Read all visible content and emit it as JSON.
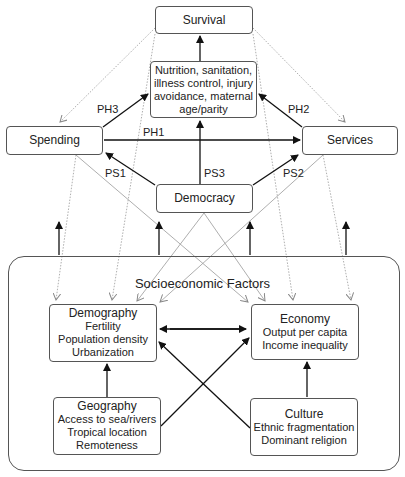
{
  "nodes": {
    "survival": {
      "title": "Survival"
    },
    "proximate": {
      "lines": [
        "Nutrition, sanitation,",
        "illness control, injury",
        "avoidance, maternal",
        "age/parity"
      ]
    },
    "spending": {
      "title": "Spending"
    },
    "services": {
      "title": "Services"
    },
    "democracy": {
      "title": "Democracy"
    },
    "demography": {
      "title": "Demography",
      "lines": [
        "Fertility",
        "Population density",
        "Urbanization"
      ]
    },
    "economy": {
      "title": "Economy",
      "lines": [
        "Output per capita",
        "Income inequality"
      ]
    },
    "geography": {
      "title": "Geography",
      "lines": [
        "Access to sea/rivers",
        "Tropical location",
        "Remoteness"
      ]
    },
    "culture": {
      "title": "Culture",
      "lines": [
        "Ethnic fragmentation",
        "Dominant religion"
      ]
    }
  },
  "group": {
    "title": "Socioeconomic Factors"
  },
  "edge_labels": {
    "ph1": "PH1",
    "ph2": "PH2",
    "ph3": "PH3",
    "ps1": "PS1",
    "ps2": "PS2",
    "ps3": "PS3"
  },
  "colors": {
    "solid_edge": "#111111",
    "dotted_edge": "#999999",
    "border": "#555555"
  }
}
